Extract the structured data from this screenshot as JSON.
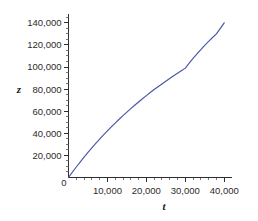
{
  "figure": {
    "background_color": "#ffffff",
    "axis_color": "#2e2e2e",
    "text_color": "#2b2b2b"
  },
  "chart_data": {
    "type": "line",
    "title": "",
    "subtitle": "",
    "xlabel": "t",
    "ylabel": "z",
    "xlim": [
      0,
      42000
    ],
    "ylim": [
      0,
      148000
    ],
    "grid": false,
    "legend": null,
    "series": [
      {
        "name": "z(t)",
        "color": "#4a56a6",
        "x": [
          0,
          1000,
          2000,
          3000,
          4000,
          5000,
          6000,
          7000,
          8000,
          9000,
          10000,
          11000,
          12000,
          13000,
          14000,
          15000,
          16000,
          17000,
          18000,
          19000,
          20000,
          21000,
          22000,
          23000,
          24000,
          25000,
          26000,
          27000,
          28000,
          29000,
          30000,
          31000,
          32000,
          33000,
          34000,
          35000,
          36000,
          37000,
          38000,
          39000,
          40000
        ],
        "y": [
          0,
          4800,
          9500,
          14000,
          18400,
          22700,
          26800,
          30800,
          34700,
          38500,
          42200,
          45800,
          49300,
          52700,
          56000,
          59200,
          62300,
          65400,
          68400,
          71300,
          74100,
          76900,
          79600,
          82200,
          84700,
          87200,
          89700,
          92100,
          94400,
          96700,
          99000,
          103500,
          107800,
          111900,
          115800,
          119600,
          123200,
          126700,
          130000,
          135000,
          140000
        ]
      }
    ],
    "x_axis": {
      "major_ticks": [
        0,
        10000,
        20000,
        30000,
        40000
      ],
      "major_tick_labels": [
        "0",
        "10,000",
        "20,000",
        "30,000",
        "40,000"
      ],
      "minor_tick_interval": 2000
    },
    "y_axis": {
      "major_ticks": [
        20000,
        40000,
        60000,
        80000,
        100000,
        120000,
        140000
      ],
      "major_tick_labels": [
        "20,000",
        "40,000",
        "60,000",
        "80,000",
        "100,000",
        "120,000",
        "140,000"
      ],
      "minor_tick_interval": 5000
    }
  }
}
